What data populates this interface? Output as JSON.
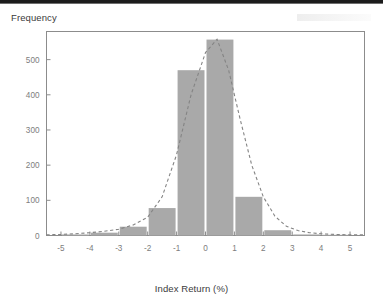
{
  "chart_data": {
    "type": "bar",
    "title": "",
    "ylabel": "Frequency",
    "xlabel": "Index Return (%)",
    "xlim": [
      -5.5,
      5.5
    ],
    "ylim": [
      0,
      580
    ],
    "grid": false,
    "legend": null,
    "bin_width": 1,
    "x_ticks": [
      -5,
      -4,
      -3,
      -2,
      -1,
      0,
      1,
      2,
      3,
      4,
      5
    ],
    "x_tick_labels": [
      "-5",
      "-4",
      "-3",
      "-2",
      "-1",
      "0",
      "1",
      "2",
      "3",
      "4",
      "5"
    ],
    "y_ticks": [
      0,
      100,
      200,
      300,
      400,
      500
    ],
    "y_tick_labels": [
      "0",
      "100",
      "200",
      "300",
      "400",
      "500"
    ],
    "categories": [
      "-5 to -4",
      "-4 to -3",
      "-3 to -2",
      "-2 to -1",
      "-1 to 0",
      "0 to 1",
      "1 to 2",
      "2 to 3",
      "3 to 4",
      "4 to 5"
    ],
    "bin_starts": [
      -5,
      -4,
      -3,
      -2,
      -1,
      0,
      1,
      2,
      3,
      4
    ],
    "values": [
      3,
      8,
      25,
      78,
      470,
      557,
      110,
      15,
      3,
      2
    ],
    "bar_color": "#a9a9a9",
    "series": [
      {
        "name": "Frequency histogram",
        "type": "bar",
        "values": [
          3,
          8,
          25,
          78,
          470,
          557,
          110,
          15,
          3,
          2
        ]
      },
      {
        "name": "Normal curve overlay",
        "type": "line",
        "style": "dashed",
        "color": "#848484",
        "x": [
          -5.5,
          -5.0,
          -4.5,
          -4.0,
          -3.5,
          -3.0,
          -2.5,
          -2.0,
          -1.5,
          -1.0,
          -0.5,
          0.0,
          0.4,
          0.8,
          1.2,
          1.6,
          2.0,
          2.4,
          2.8,
          3.2,
          3.6,
          4.0,
          4.5,
          5.0,
          5.5
        ],
        "values": [
          2,
          3,
          5,
          8,
          12,
          18,
          30,
          52,
          110,
          230,
          400,
          520,
          558,
          470,
          330,
          200,
          110,
          55,
          26,
          14,
          8,
          5,
          3,
          2,
          2
        ]
      }
    ],
    "annotations": []
  },
  "axis": {
    "y_title": "Frequency",
    "x_title": "Index Return (%)"
  }
}
